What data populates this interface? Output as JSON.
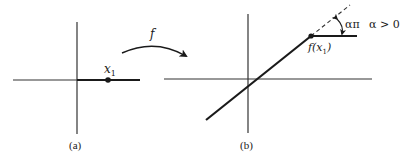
{
  "panel_a": {
    "caption": "(a)",
    "point_label": "x",
    "point_subscript": "1"
  },
  "mapping": {
    "label": "f"
  },
  "panel_b": {
    "caption": "(b)",
    "point_label_prefix": "f(x",
    "point_subscript": "1",
    "point_label_suffix": ")",
    "angle_label": "απ",
    "condition_label": "α > 0"
  },
  "colors": {
    "ink": "#1a1a1a",
    "axis": "#333333",
    "background": "#ffffff"
  }
}
